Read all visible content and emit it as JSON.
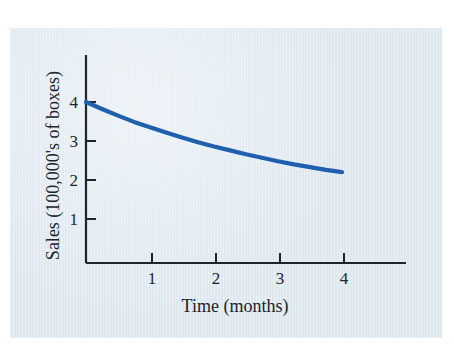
{
  "chart_data": {
    "type": "line",
    "title": "",
    "xlabel": "Time (months)",
    "ylabel": "Sales (100,000's of boxes)",
    "xlim": [
      0,
      5
    ],
    "ylim": [
      0,
      4.6
    ],
    "xticks": [
      "1",
      "2",
      "3",
      "4"
    ],
    "xtick_values": [
      1,
      2,
      3,
      4
    ],
    "yticks": [
      "1",
      "2",
      "3",
      "4"
    ],
    "ytick_values": [
      1,
      2,
      3,
      4
    ],
    "grid": false,
    "legend": null,
    "series": [
      {
        "name": "Sales",
        "color": "#1f5fad",
        "x": [
          0,
          0.25,
          0.5,
          0.75,
          1,
          1.25,
          1.5,
          1.75,
          2,
          2.25,
          2.5,
          2.75,
          3,
          3.25,
          3.5,
          3.75,
          4
        ],
        "values": [
          4.0,
          3.82,
          3.65,
          3.49,
          3.35,
          3.22,
          3.09,
          2.97,
          2.86,
          2.76,
          2.66,
          2.57,
          2.48,
          2.4,
          2.33,
          2.26,
          2.2
        ]
      }
    ],
    "annotations": []
  },
  "axes": {
    "x_title": "Time (months)",
    "y_title": "Sales (100,000's of boxes)",
    "x_tick_labels": [
      "1",
      "2",
      "3",
      "4"
    ],
    "y_tick_labels": [
      "1",
      "2",
      "3",
      "4"
    ]
  },
  "colors": {
    "curve": "#1f5fad",
    "axis": "#20242b",
    "panel_background": "#dde7f0",
    "page_background": "#ffffff"
  }
}
